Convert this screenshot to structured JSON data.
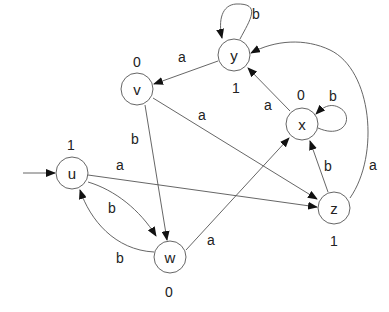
{
  "diagram": {
    "type": "moore-machine-state-diagram",
    "start_state": "u",
    "states": [
      {
        "id": "y",
        "label": "y",
        "output": "1"
      },
      {
        "id": "v",
        "label": "v",
        "output": "0"
      },
      {
        "id": "x",
        "label": "x",
        "output": "0"
      },
      {
        "id": "u",
        "label": "u",
        "output": "1"
      },
      {
        "id": "z",
        "label": "z",
        "output": "1"
      },
      {
        "id": "w",
        "label": "w",
        "output": "0"
      }
    ],
    "transitions": [
      {
        "from": "y",
        "to": "y",
        "label": "b"
      },
      {
        "from": "y",
        "to": "v",
        "label": "a"
      },
      {
        "from": "v",
        "to": "w",
        "label": "b"
      },
      {
        "from": "v",
        "to": "z",
        "label": "a"
      },
      {
        "from": "x",
        "to": "x",
        "label": "b"
      },
      {
        "from": "x",
        "to": "y",
        "label": "a"
      },
      {
        "from": "z",
        "to": "x",
        "label": "b"
      },
      {
        "from": "z",
        "to": "y",
        "label": "a"
      },
      {
        "from": "u",
        "to": "z",
        "label": "a"
      },
      {
        "from": "u",
        "to": "w",
        "label": "b"
      },
      {
        "from": "w",
        "to": "u",
        "label": "b"
      },
      {
        "from": "w",
        "to": "x",
        "label": "a"
      }
    ]
  }
}
